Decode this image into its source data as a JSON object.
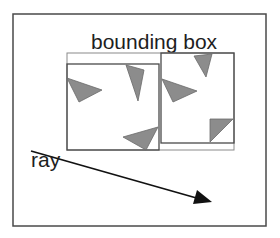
{
  "diagram": {
    "title_label": "bounding box",
    "ray_label": "ray",
    "colors": {
      "stroke": "#4a4a4a",
      "thin_stroke": "#8a8a8a",
      "triangle_fill": "#8c8c8c",
      "triangle_stroke": "#6a6a6a",
      "arrow": "#111111",
      "text": "#1e1e1e",
      "background": "#ffffff"
    },
    "frame": {
      "x": 13,
      "y": 14,
      "w": 253,
      "h": 212
    },
    "parent_box": {
      "x": 67,
      "y": 53,
      "w": 167,
      "h": 97
    },
    "child_boxes": [
      {
        "name": "left-child-box",
        "x": 67,
        "y": 64,
        "w": 92,
        "h": 86
      },
      {
        "name": "right-child-box",
        "x": 161,
        "y": 53,
        "w": 73,
        "h": 90
      }
    ],
    "triangles": [
      {
        "points": "67,78 102,90 79,102"
      },
      {
        "points": "126,65 144,70 138,101"
      },
      {
        "points": "123,137 158,127 146,150"
      },
      {
        "points": "194,56 212,54 206,77"
      },
      {
        "points": "162,79 197,91 173,102"
      },
      {
        "points": "210,119 233,119 210,142"
      }
    ],
    "ray": {
      "x1": 31,
      "y1": 151,
      "x2": 211,
      "y2": 202
    }
  }
}
